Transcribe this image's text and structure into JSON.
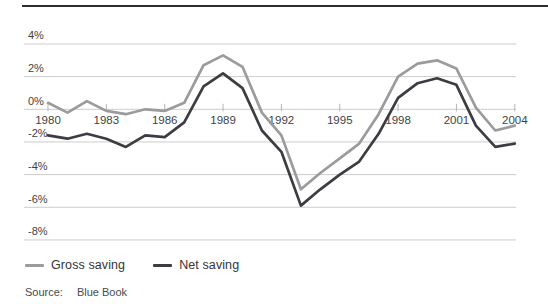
{
  "chart_data": {
    "type": "line",
    "x": [
      1980,
      1981,
      1982,
      1983,
      1984,
      1985,
      1986,
      1987,
      1988,
      1989,
      1990,
      1991,
      1992,
      1993,
      1994,
      1995,
      1996,
      1997,
      1998,
      1999,
      2000,
      2001,
      2002,
      2003,
      2004
    ],
    "x_ticks": [
      {
        "value": 1980,
        "label": "1980"
      },
      {
        "value": 1983,
        "label": "1983"
      },
      {
        "value": 1986,
        "label": "1986"
      },
      {
        "value": 1989,
        "label": "1989"
      },
      {
        "value": 1992,
        "label": "1992"
      },
      {
        "value": 1995,
        "label": "1995"
      },
      {
        "value": 1998,
        "label": "1998"
      },
      {
        "value": 2001,
        "label": "2001"
      },
      {
        "value": 2004,
        "label": "2004"
      }
    ],
    "y_ticks": [
      {
        "value": 4,
        "label": "4%"
      },
      {
        "value": 2,
        "label": "2%"
      },
      {
        "value": 0,
        "label": "0%"
      },
      {
        "value": -2,
        "label": "-2%"
      },
      {
        "value": -4,
        "label": "-4%"
      },
      {
        "value": -6,
        "label": "-6%"
      },
      {
        "value": -8,
        "label": "-8%"
      }
    ],
    "ylim": [
      -8,
      4
    ],
    "grid": true,
    "legend_position": "bottom-left",
    "series": [
      {
        "name": "Gross saving",
        "color": "#9b9b9b",
        "values": [
          0.4,
          -0.2,
          0.5,
          -0.1,
          -0.3,
          0.0,
          -0.1,
          0.4,
          2.7,
          3.3,
          2.6,
          -0.2,
          -1.6,
          -4.9,
          -3.9,
          -3.0,
          -2.1,
          -0.3,
          2.0,
          2.8,
          3.0,
          2.5,
          0.1,
          -1.3,
          -1.0
        ]
      },
      {
        "name": "Net saving",
        "color": "#3c3c42",
        "values": [
          -1.6,
          -1.8,
          -1.5,
          -1.8,
          -2.3,
          -1.6,
          -1.7,
          -0.8,
          1.4,
          2.2,
          1.3,
          -1.3,
          -2.6,
          -5.9,
          -4.9,
          -4.0,
          -3.2,
          -1.5,
          0.7,
          1.6,
          1.9,
          1.5,
          -1.0,
          -2.3,
          -2.1
        ]
      }
    ]
  },
  "colors": {
    "top_rule": "#2d2d2d",
    "gridline": "#cccccc",
    "tick": "#b5b5b5",
    "axis_text": "#3f3f3f"
  },
  "source": {
    "label": "Source:",
    "text": "Blue Book"
  }
}
